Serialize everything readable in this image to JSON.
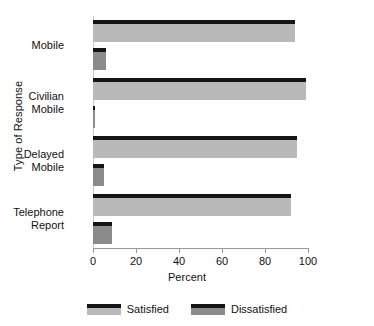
{
  "chart_data": {
    "type": "bar",
    "orientation": "horizontal",
    "title": "",
    "xlabel": "Percent",
    "ylabel": "Type of Response",
    "xlim": [
      0,
      100
    ],
    "xticks": [
      0,
      20,
      40,
      60,
      80,
      100
    ],
    "grid": false,
    "legend_position": "bottom",
    "categories": [
      "Mobile",
      "Civilian\nMobile",
      "Delayed\nMobile",
      "Telephone\nReport"
    ],
    "series": [
      {
        "name": "Satisfied",
        "color": "#b9b9b9",
        "values": [
          94,
          99,
          95,
          92
        ]
      },
      {
        "name": "Dissatisfied",
        "color": "#8b8b8b",
        "values": [
          6,
          1,
          5,
          9
        ]
      }
    ]
  },
  "axes": {
    "x_title": "Percent",
    "y_title": "Type of Response",
    "x_tick_labels": [
      "0",
      "20",
      "40",
      "60",
      "80",
      "100"
    ]
  },
  "legend": {
    "items": [
      {
        "label": "Satisfied"
      },
      {
        "label": "Dissatisfied"
      }
    ]
  },
  "categories": [
    {
      "label": "Mobile"
    },
    {
      "label": "Civilian\nMobile"
    },
    {
      "label": "Delayed\nMobile"
    },
    {
      "label": "Telephone\nReport"
    }
  ]
}
